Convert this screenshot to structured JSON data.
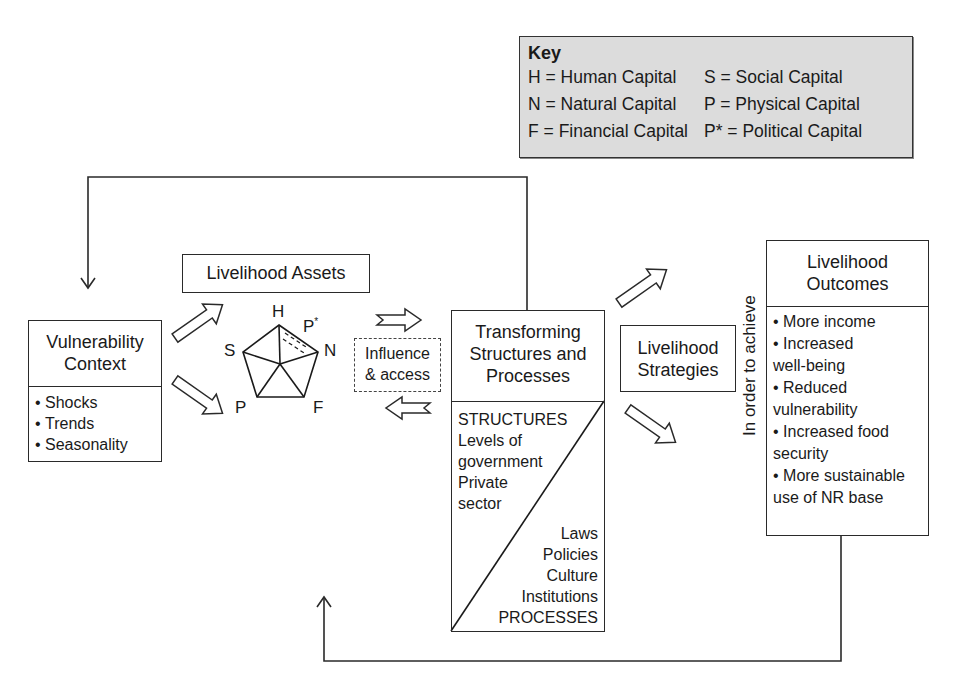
{
  "key": {
    "title": "Key",
    "entries": [
      {
        "abbr": "H",
        "text": "H = Human Capital"
      },
      {
        "abbr": "S",
        "text": "S = Social Capital"
      },
      {
        "abbr": "N",
        "text": "N = Natural Capital"
      },
      {
        "abbr": "P",
        "text": "P = Physical Capital"
      },
      {
        "abbr": "F",
        "text": "F = Financial Capital"
      },
      {
        "abbr": "P*",
        "text": "P* = Political Capital"
      }
    ]
  },
  "vulnerability": {
    "title_line1": "Vulnerability",
    "title_line2": "Context",
    "items": [
      "Shocks",
      "Trends",
      "Seasonality"
    ]
  },
  "assets": {
    "title": "Livelihood Assets",
    "labels": {
      "H": "H",
      "Pstar": "P*",
      "N": "N",
      "F": "F",
      "P": "P",
      "S": "S"
    }
  },
  "influence": {
    "line1": "Influence",
    "line2": "& access"
  },
  "transforming": {
    "title_line1": "Transforming",
    "title_line2": "Structures and",
    "title_line3": "Processes",
    "structures": [
      "STRUCTURES",
      "Levels of",
      "government",
      "Private",
      "sector"
    ],
    "processes": [
      "Laws",
      "Policies",
      "Culture",
      "Institutions",
      "PROCESSES"
    ]
  },
  "strategies": {
    "line1": "Livelihood",
    "line2": "Strategies"
  },
  "connector_text": "In order to achieve",
  "outcomes": {
    "title_line1": "Livelihood",
    "title_line2": "Outcomes",
    "items": [
      [
        "More income"
      ],
      [
        "Increased",
        "well-being"
      ],
      [
        "Reduced",
        "vulnerability"
      ],
      [
        "Increased food",
        "security"
      ],
      [
        "More sustainable",
        "use of NR base"
      ]
    ]
  }
}
